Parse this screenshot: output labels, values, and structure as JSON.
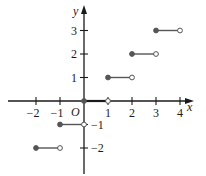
{
  "chart_data": {
    "type": "line",
    "title": "",
    "xlabel": "x",
    "ylabel": "y",
    "origin_label": "O",
    "xlim": [
      -2.6,
      4.5
    ],
    "ylim": [
      -3.1,
      4.0
    ],
    "grid": false,
    "legend": "none",
    "x_ticks": [
      -2,
      -1,
      1,
      2,
      3,
      4
    ],
    "x_tick_labels": [
      "−2",
      "−1",
      "1",
      "2",
      "3",
      "4"
    ],
    "y_ticks": [
      3,
      2,
      1,
      -1,
      -2
    ],
    "y_tick_labels": [
      "3",
      "2",
      "1",
      "−1",
      "−2"
    ],
    "series": [
      {
        "name": "greatest integer function y = [x]",
        "segments": [
          {
            "x_start": -2,
            "x_end": -1,
            "y": -2,
            "start_closed": true,
            "end_closed": false
          },
          {
            "x_start": -1,
            "x_end": 0,
            "y": -1,
            "start_closed": true,
            "end_closed": false
          },
          {
            "x_start": 0,
            "x_end": 1,
            "y": 0,
            "start_closed": true,
            "end_closed": false
          },
          {
            "x_start": 1,
            "x_end": 2,
            "y": 1,
            "start_closed": true,
            "end_closed": false
          },
          {
            "x_start": 2,
            "x_end": 3,
            "y": 2,
            "start_closed": true,
            "end_closed": false
          },
          {
            "x_start": 3,
            "x_end": 4,
            "y": 3,
            "start_closed": true,
            "end_closed": false
          }
        ]
      }
    ],
    "colors": {
      "axis": "#1a1a1a",
      "segment": "#555555",
      "dot_fill": "#555555",
      "open_dot_fill": "#ffffff"
    }
  }
}
